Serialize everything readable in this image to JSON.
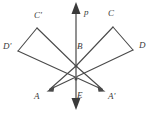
{
  "diagram": {
    "type": "geometry-reflection",
    "background_color": "#ffffff",
    "stroke_color": "#4a4a4a",
    "label_color": "#3a3a3a",
    "axis": {
      "name": "p",
      "label": "p",
      "label_x": 84,
      "label_y": 8,
      "x": 76,
      "y_top": 3,
      "y_bottom": 109,
      "arrow_top": true,
      "arrow_bottom": true
    },
    "points": [
      {
        "id": "C-prime",
        "label": "C'",
        "x": 37,
        "y": 28,
        "label_x": 34,
        "label_y": 11
      },
      {
        "id": "D-prime",
        "label": "D'",
        "x": 18,
        "y": 51,
        "label_x": 3,
        "label_y": 42
      },
      {
        "id": "A",
        "label": "A",
        "x": 48,
        "y": 91,
        "label_x": 34,
        "label_y": 92
      },
      {
        "id": "B",
        "label": "B",
        "x": 76,
        "y": 66,
        "label_x": 77,
        "label_y": 42
      },
      {
        "id": "E",
        "label": "E",
        "x": 76,
        "y": 79,
        "label_x": 77,
        "label_y": 91
      },
      {
        "id": "A-prime",
        "label": "A'",
        "x": 104,
        "y": 91,
        "label_x": 108,
        "label_y": 92
      },
      {
        "id": "C",
        "label": "C",
        "x": 113,
        "y": 27,
        "label_x": 108,
        "label_y": 9
      },
      {
        "id": "D",
        "label": "D",
        "x": 133,
        "y": 50,
        "label_x": 139,
        "label_y": 41
      }
    ],
    "segments": [
      {
        "id": "seg-B-C",
        "from": "B",
        "to": "C",
        "x1": 76,
        "y1": 66,
        "x2": 113,
        "y2": 27
      },
      {
        "id": "seg-C-D",
        "from": "C",
        "to": "D",
        "x1": 113,
        "y1": 27,
        "x2": 133,
        "y2": 50
      },
      {
        "id": "seg-D-A",
        "from": "D",
        "to": "A",
        "x1": 133,
        "y1": 50,
        "x2": 48,
        "y2": 91
      },
      {
        "id": "seg-A-B",
        "from": "A",
        "to": "B",
        "x1": 48,
        "y1": 91,
        "x2": 76,
        "y2": 66
      },
      {
        "id": "seg-B-Cprime",
        "from": "B",
        "to": "C-prime",
        "x1": 76,
        "y1": 66,
        "x2": 37,
        "y2": 28
      },
      {
        "id": "seg-Cprime-Dprime",
        "from": "C-prime",
        "to": "D-prime",
        "x1": 37,
        "y1": 28,
        "x2": 18,
        "y2": 51
      },
      {
        "id": "seg-Dprime-Aprime",
        "from": "D-prime",
        "to": "A-prime",
        "x1": 18,
        "y1": 51,
        "x2": 104,
        "y2": 91
      },
      {
        "id": "seg-Aprime-B",
        "from": "A-prime",
        "to": "B",
        "x1": 104,
        "y1": 91,
        "x2": 76,
        "y2": 66
      }
    ],
    "arrow_heads": [
      {
        "id": "arrowhead-A",
        "at": "A",
        "x": 48,
        "y": 91
      },
      {
        "id": "arrowhead-Ap",
        "at": "A-prime",
        "x": 104,
        "y": 91
      }
    ]
  }
}
